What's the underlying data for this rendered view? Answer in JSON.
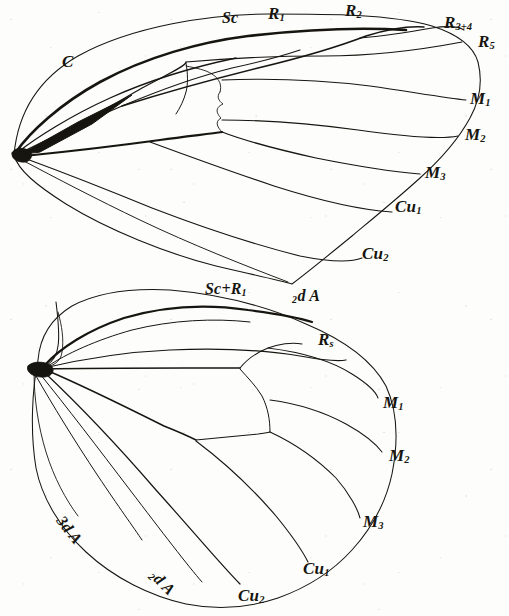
{
  "figure": {
    "kind": "scientific-illustration",
    "background_color": "#fdfdfc",
    "ink_color": "#17150f"
  },
  "forewing": {
    "name": "forewing",
    "labels": [
      {
        "id": "c",
        "text": "C",
        "base": "C",
        "sub": "",
        "x": 62,
        "y": 53,
        "rotate": 0,
        "size": 17
      },
      {
        "id": "sc",
        "text": "Sc",
        "base": "Sc",
        "sub": "",
        "x": 222,
        "y": 10,
        "rotate": 0,
        "size": 16
      },
      {
        "id": "r1",
        "text": "R1",
        "base": "R",
        "sub": "1",
        "x": 268,
        "y": 5,
        "rotate": 0,
        "size": 17
      },
      {
        "id": "r2",
        "text": "R2",
        "base": "R",
        "sub": "2",
        "x": 345,
        "y": 2,
        "rotate": 0,
        "size": 17
      },
      {
        "id": "r34",
        "text": "R3+4",
        "base": "R",
        "sub": "3+4",
        "x": 444,
        "y": 14,
        "rotate": 0,
        "size": 17
      },
      {
        "id": "r5",
        "text": "R5",
        "base": "R",
        "sub": "5",
        "x": 478,
        "y": 33,
        "rotate": 0,
        "size": 17
      },
      {
        "id": "m1",
        "text": "M1",
        "base": "M",
        "sub": "1",
        "x": 470,
        "y": 90,
        "rotate": 0,
        "size": 17
      },
      {
        "id": "m2",
        "text": "M2",
        "base": "M",
        "sub": "2",
        "x": 465,
        "y": 126,
        "rotate": 0,
        "size": 17
      },
      {
        "id": "m3",
        "text": "M3",
        "base": "M",
        "sub": "3",
        "x": 425,
        "y": 164,
        "rotate": 0,
        "size": 17
      },
      {
        "id": "cu1",
        "text": "Cu1",
        "base": "Cu",
        "sub": "1",
        "x": 395,
        "y": 198,
        "rotate": 0,
        "size": 17
      },
      {
        "id": "cu2",
        "text": "Cu2",
        "base": "Cu",
        "sub": "2",
        "x": 362,
        "y": 245,
        "rotate": 0,
        "size": 17
      }
    ]
  },
  "hindwing": {
    "name": "hindwing",
    "labels": [
      {
        "id": "sc-r1",
        "text": "Sc+R1",
        "base": "Sc+R",
        "sub": "1",
        "x": 205,
        "y": 281,
        "rotate": 0,
        "size": 16
      },
      {
        "id": "a2-top",
        "text": "2d A",
        "base": "d A",
        "sub": "",
        "pre": "2",
        "x": 292,
        "y": 288,
        "rotate": 0,
        "size": 16
      },
      {
        "id": "rs",
        "text": "Rs",
        "base": "R",
        "sub": "s",
        "x": 318,
        "y": 331,
        "rotate": 0,
        "size": 17
      },
      {
        "id": "hm1",
        "text": "M1",
        "base": "M",
        "sub": "1",
        "x": 383,
        "y": 394,
        "rotate": 0,
        "size": 17
      },
      {
        "id": "hm2",
        "text": "M2",
        "base": "M",
        "sub": "2",
        "x": 389,
        "y": 447,
        "rotate": 0,
        "size": 17
      },
      {
        "id": "hm3",
        "text": "M3",
        "base": "M",
        "sub": "3",
        "x": 363,
        "y": 513,
        "rotate": 0,
        "size": 17
      },
      {
        "id": "hcu1",
        "text": "Cu1",
        "base": "Cu",
        "sub": "1",
        "x": 303,
        "y": 560,
        "rotate": 0,
        "size": 17
      },
      {
        "id": "hcu2",
        "text": "Cu2",
        "base": "Cu",
        "sub": "2",
        "x": 238,
        "y": 587,
        "rotate": 0,
        "size": 17
      },
      {
        "id": "a3",
        "text": "3d A",
        "base": "3d A",
        "sub": "",
        "x": 66,
        "y": 513,
        "rotate": 52,
        "size": 16
      },
      {
        "id": "a2-bot",
        "text": "2d A",
        "base": "d A",
        "sub": "",
        "pre": "2",
        "x": 158,
        "y": 567,
        "rotate": 45,
        "size": 16
      }
    ]
  }
}
